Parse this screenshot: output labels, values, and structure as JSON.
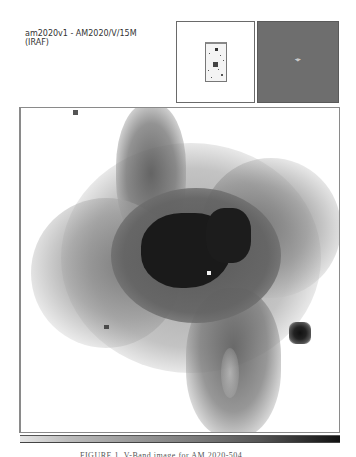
{
  "window": {
    "title_line1": "am2020v1 - AM2020/V/15M",
    "title_line2": "(IRAF)"
  },
  "panner": {
    "label": "panner",
    "background": "#ffffff"
  },
  "magnifier": {
    "label": "magnifier",
    "background": "#6e6e6e",
    "cursor_icon": "crosshair-cursor-icon",
    "cursor_glyph": "⌖"
  },
  "main_image": {
    "label": "V-band galaxy image display",
    "colormap": "grayscale-inverted"
  },
  "colorbar": {
    "from_color": "#e6e6e6",
    "to_color": "#111111"
  },
  "caption": {
    "text": "FIGURE 1.  V-Band image for AM 2020-504"
  }
}
